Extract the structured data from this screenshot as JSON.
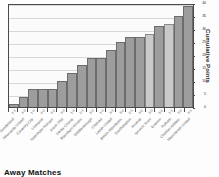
{
  "chart_data": {
    "type": "bar",
    "title": "Away Matches",
    "xlabel": "",
    "ylabel": "Cumulative Points",
    "ylim": [
      0,
      40
    ],
    "yticks": [
      0,
      5,
      10,
      15,
      20,
      25,
      30,
      35,
      40
    ],
    "grid": true,
    "legend": "none",
    "categories": [
      "Sunderland",
      "Newcastle United",
      "Coventry City",
      "Liverpool",
      "Tottenham Hotspur",
      "Aston Villa",
      "Derby County",
      "Blackburn Rovers",
      "Middlesbrough",
      "Chelsea",
      "Leeds United",
      "Bolton Wanderers",
      "Southampton",
      "Arsenal",
      "Ipswich Town",
      "Everton",
      "Fulham",
      "Charlton Athletic",
      "Manchester United"
    ],
    "values": [
      1,
      4,
      7,
      7,
      7,
      10,
      13,
      16,
      19,
      19,
      22,
      25,
      27,
      27,
      28,
      31,
      32,
      35,
      39
    ],
    "scores": [
      "1-1",
      "4-0",
      "1-0",
      "0-2",
      "0-2",
      "3-0",
      "1-0",
      "2-1",
      "3-0",
      "1-0",
      "3-1",
      "3-2",
      "2-1",
      "3-2",
      "3-0",
      "5-2",
      "1-1",
      "3-0",
      "3-1"
    ],
    "bar_shade": [
      "dark",
      "dark",
      "dark",
      "dark",
      "dark",
      "dark",
      "dark",
      "dark",
      "dark",
      "dark",
      "dark",
      "dark",
      "dark",
      "dark",
      "light",
      "dark",
      "light",
      "dark",
      "dark"
    ],
    "colors": {
      "bar_dark": "#9d9d9d",
      "bar_light": "#c9c9c9",
      "bar_outline": "#6c6c6c",
      "grid": "#d8d8d8",
      "axis": "#4a4a4a",
      "plot_background": "#fbfbfb",
      "text": "#2b2b2b"
    }
  }
}
